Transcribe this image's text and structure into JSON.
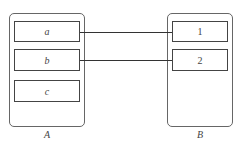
{
  "diagram": {
    "set_a": {
      "label": "A",
      "elements": [
        "a",
        "b",
        "c"
      ]
    },
    "set_b": {
      "label": "B",
      "elements": [
        "1",
        "2"
      ]
    },
    "mappings": [
      {
        "from": "a",
        "to": "1"
      },
      {
        "from": "b",
        "to": "2"
      }
    ]
  }
}
